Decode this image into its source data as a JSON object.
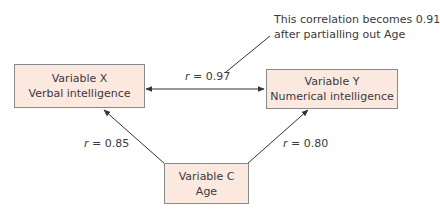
{
  "nodes": {
    "x": {
      "line1": "Variable X",
      "line2": "Verbal intelligence"
    },
    "y": {
      "line1": "Variable Y",
      "line2": "Numerical intelligence"
    },
    "c": {
      "line1": "Variable C",
      "line2": "Age"
    }
  },
  "edges": {
    "xy": {
      "r_symbol": "r",
      "value": "= 0.97"
    },
    "cx": {
      "r_symbol": "r",
      "value": "= 0.85"
    },
    "cy": {
      "r_symbol": "r",
      "value": "= 0.80"
    }
  },
  "annotation": {
    "line1": "This correlation becomes 0.91",
    "line2": "after partialling out Age"
  },
  "colors": {
    "box_fill": "#fbe9e0",
    "box_border": "#8a8a8a",
    "line": "#333333"
  }
}
